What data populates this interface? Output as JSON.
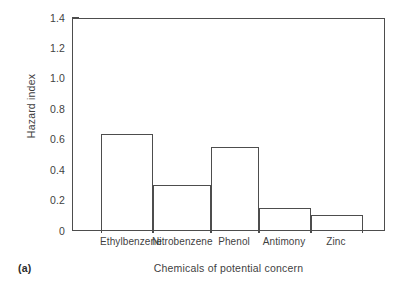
{
  "figure": {
    "panel_caption": "(a)",
    "background_color": "#ffffff",
    "line_color": "#4d4d4d",
    "text_color": "#3f3f3f"
  },
  "chart_data": {
    "type": "bar",
    "title": "",
    "subtitle": "",
    "categories": [
      "Ethylbenzene",
      "Nitrobenzene",
      "Phenol",
      "Antimony",
      "Zinc"
    ],
    "values": [
      0.645,
      0.31,
      0.56,
      0.16,
      0.11
    ],
    "xlabel": "Chemicals of potential concern",
    "ylabel": "Hazard index",
    "ylim": [
      0,
      1.4
    ],
    "ytick_values": [
      0,
      0.2,
      0.4,
      0.6,
      0.8,
      1.0,
      1.2,
      1.4
    ],
    "ytick_labels": [
      "0",
      "0.2",
      "0.4",
      "0.6",
      "0.8",
      "1.0",
      "1.2",
      "1.4"
    ],
    "grid": false,
    "legend": null,
    "bar_style": "outline",
    "bar_fill": "none",
    "bar_edge_color": "#4d4d4d",
    "annotations": []
  }
}
